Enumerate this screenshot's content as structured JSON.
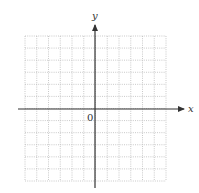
{
  "figure": {
    "type": "blank-coordinate-grid",
    "grid": {
      "columns": 12,
      "rows": 12,
      "line_style": "dotted",
      "line_color": "#bbbbbb",
      "left": 25,
      "top": 36,
      "right": 166,
      "bottom": 181
    },
    "axes": {
      "color": "#333333",
      "x_axis": {
        "label": "x",
        "y": 109,
        "x_start": 18,
        "x_end": 184
      },
      "y_axis": {
        "label": "y",
        "x": 95,
        "y_start": 188,
        "y_end": 25
      }
    },
    "origin_label": "0"
  }
}
